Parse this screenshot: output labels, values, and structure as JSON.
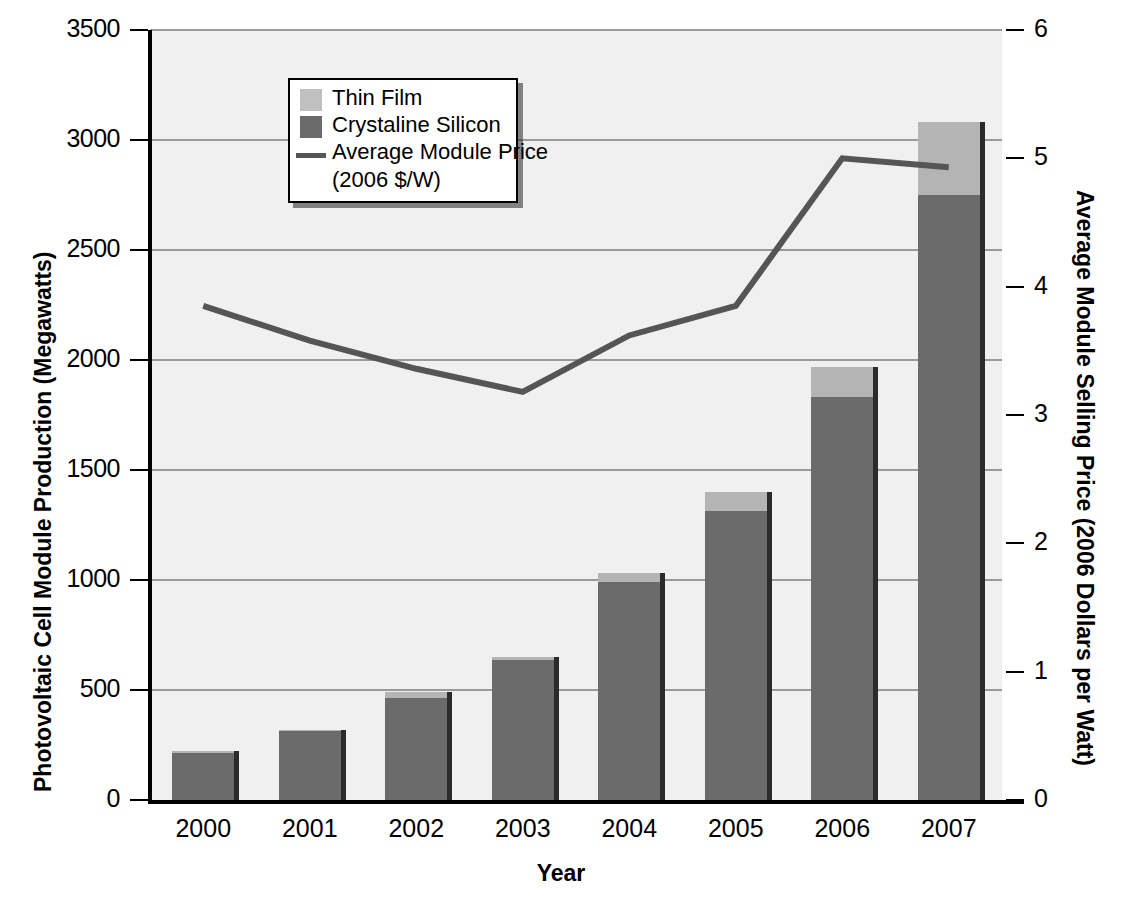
{
  "chart_data": {
    "type": "bar",
    "title": "",
    "xlabel": "Year",
    "ylabel": "Photovoltaic Cell Module Production (Megawatts)",
    "y2label": "Average Module Selling Price (2006 Dollars per Watt)",
    "categories": [
      "2000",
      "2001",
      "2002",
      "2003",
      "2004",
      "2005",
      "2006",
      "2007"
    ],
    "ylim": [
      0,
      3500
    ],
    "yticks": [
      "0",
      "500",
      "1000",
      "1500",
      "2000",
      "2500",
      "3000",
      "3500"
    ],
    "ytick_values": [
      0,
      500,
      1000,
      1500,
      2000,
      2500,
      3000,
      3500
    ],
    "y2lim": [
      0,
      6
    ],
    "y2ticks": [
      "0",
      "1",
      "2",
      "3",
      "4",
      "5",
      "6"
    ],
    "y2tick_values": [
      0,
      1,
      2,
      3,
      4,
      5,
      6
    ],
    "grid": true,
    "legend_position": "upper-left-inside",
    "stacked": true,
    "series": [
      {
        "name": "Crystaline Silicon",
        "kind": "bar",
        "color": "#6b6b6b",
        "axis": "left",
        "values": [
          215,
          312,
          465,
          638,
          990,
          1315,
          1830,
          2750
        ]
      },
      {
        "name": "Thin Film",
        "kind": "bar",
        "color": "#b4b4b4",
        "axis": "left",
        "values": [
          10,
          8,
          28,
          10,
          42,
          85,
          140,
          330
        ]
      },
      {
        "name": "Average Module Price (2006 $/W)",
        "kind": "line",
        "color": "#555555",
        "axis": "right",
        "values": [
          3.85,
          3.58,
          3.36,
          3.18,
          3.62,
          3.85,
          5.0,
          4.93
        ]
      }
    ],
    "stack_totals": [
      225,
      320,
      493,
      648,
      1032,
      1400,
      1970,
      3080
    ]
  },
  "legend": {
    "items": [
      {
        "label": "Thin Film",
        "sub": "",
        "swatch": "thin-film-swatch"
      },
      {
        "label": "Crystaline Silicon",
        "sub": "",
        "swatch": "crystaline-silicon-swatch"
      },
      {
        "label": "Average Module Price",
        "sub": "(2006 $/W)",
        "swatch": "price-line-swatch"
      }
    ]
  },
  "colors": {
    "thin_film": "#b4b4b4",
    "crystaline_silicon": "#6b6b6b",
    "price_line": "#555555",
    "plot_background": "#f0f0f0",
    "gridline": "#9a9a9a",
    "axis": "#000000"
  }
}
